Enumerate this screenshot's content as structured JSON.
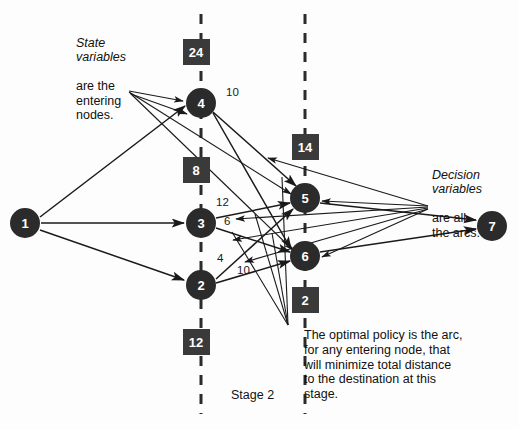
{
  "diagram": {
    "colors": {
      "node_fill": "#2b2b2b",
      "node_text": "#ffffff",
      "box_fill": "#3a3a3a",
      "arc": "#1a1a1a",
      "dashed_line": "#2b2b2b",
      "background": "#fdfdfd"
    },
    "nodes": [
      {
        "id": "1",
        "label": "1",
        "x": 25,
        "y": 223,
        "r": 15
      },
      {
        "id": "4",
        "label": "4",
        "x": 201,
        "y": 103,
        "r": 15
      },
      {
        "id": "3",
        "label": "3",
        "x": 201,
        "y": 223,
        "r": 15
      },
      {
        "id": "2",
        "label": "2",
        "x": 201,
        "y": 285,
        "r": 15
      },
      {
        "id": "5",
        "label": "5",
        "x": 305,
        "y": 198,
        "r": 15
      },
      {
        "id": "6",
        "label": "6",
        "x": 305,
        "y": 256,
        "r": 15
      },
      {
        "id": "7",
        "label": "7",
        "x": 492,
        "y": 226,
        "r": 15
      }
    ],
    "value_boxes": [
      {
        "id": "box-24",
        "label": "24",
        "x": 196,
        "y": 52,
        "w": 27,
        "h": 26
      },
      {
        "id": "box-8",
        "label": "8",
        "x": 196,
        "y": 170,
        "w": 27,
        "h": 26
      },
      {
        "id": "box-12",
        "label": "12",
        "x": 196,
        "y": 342,
        "w": 27,
        "h": 26
      },
      {
        "id": "box-14",
        "label": "14",
        "x": 305,
        "y": 147,
        "w": 27,
        "h": 26
      },
      {
        "id": "box-2",
        "label": "2",
        "x": 305,
        "y": 300,
        "w": 27,
        "h": 26
      }
    ],
    "dashed_lines": [
      {
        "id": "dashed-stage-2",
        "x": 201,
        "y1": 14,
        "y2": 414
      },
      {
        "id": "dashed-stage-3",
        "x": 305,
        "y1": 14,
        "y2": 414
      }
    ],
    "arc_weights": [
      {
        "id": "w-4-5",
        "label": "10",
        "x": 222,
        "y": 94
      },
      {
        "id": "w-3-5",
        "label": "12",
        "x": 222,
        "y": 202
      },
      {
        "id": "w-3-6",
        "label": "6",
        "x": 226,
        "y": 221
      },
      {
        "id": "w-2-5",
        "label": "4",
        "x": 222,
        "y": 251
      },
      {
        "id": "w-2-6",
        "label": "10",
        "x": 242,
        "y": 264
      }
    ],
    "arcs": [
      {
        "from": "1",
        "to": "4"
      },
      {
        "from": "1",
        "to": "3"
      },
      {
        "from": "1",
        "to": "2"
      },
      {
        "from": "4",
        "to": "5"
      },
      {
        "from": "4",
        "to": "6"
      },
      {
        "from": "3",
        "to": "5"
      },
      {
        "from": "3",
        "to": "6"
      },
      {
        "from": "2",
        "to": "5"
      },
      {
        "from": "2",
        "to": "6"
      },
      {
        "from": "5",
        "to": "7"
      },
      {
        "from": "6",
        "to": "7"
      }
    ],
    "callouts": [
      {
        "id": "callout-state-variables",
        "emphasis": "State\nvariables",
        "rest": "are the\nentering\nnodes.",
        "x": 76,
        "y": 23,
        "pointer_from": {
          "x": 128,
          "y": 91
        },
        "pointer_to_nodes": [
          "4",
          "5",
          "6"
        ]
      },
      {
        "id": "callout-decision-variables",
        "emphasis": "Decision\nvariables",
        "rest": "are all\nthe arcs.",
        "x": 432,
        "y": 155,
        "pointer_from": {
          "x": 428,
          "y": 205
        }
      }
    ],
    "policy_note": {
      "id": "policy-note",
      "text": "The optimal policy is the arc,\nfor any entering node, that\nwill minimize total distance\nto the destination at this\nstage.",
      "x": 304,
      "y": 331
    },
    "stage_label": {
      "id": "stage-label",
      "text": "Stage 2",
      "x": 231,
      "y": 388
    }
  }
}
